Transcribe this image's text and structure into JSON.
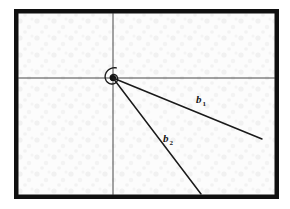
{
  "figure": {
    "kind": "logarithmic-spiral-diagram",
    "width": 290,
    "height": 209,
    "background_color": "#fbfbfb",
    "page_color": "#ffffff",
    "frame": {
      "name": "figure-border",
      "color": "#101010",
      "x": 14,
      "y": 9,
      "width": 265,
      "height": 190,
      "stroke_width": 4.5
    },
    "ink_color": "#1a1a1a",
    "axis_color": "#333333",
    "axis_stroke_width": 0.9,
    "curve_stroke_width": 1.3,
    "vector_stroke_width": 1.5
  },
  "labels": {
    "b1": {
      "base": "b",
      "sub": "1",
      "x": 196,
      "y": 103
    },
    "b2": {
      "base": "b",
      "sub": "2",
      "x": 163,
      "y": 142
    }
  },
  "chart_data": {
    "type": "line",
    "title": "",
    "subtitle": "",
    "xlabel": "",
    "ylabel": "",
    "grid": false,
    "legend_position": "none",
    "curve_name": "logarithmic spiral",
    "polar_equation": "r = a * e^(k*theta)",
    "pole": {
      "x": 113,
      "y": 78
    },
    "spiral_params": {
      "a": 0.55,
      "k": 0.1685,
      "theta_start": -2.2,
      "theta_end": 17.6
    },
    "axes": [
      {
        "name": "horizontal-axis",
        "x1": 18,
        "y1": 78,
        "x2": 275,
        "y2": 78
      },
      {
        "name": "vertical-axis",
        "x1": 113,
        "y1": 13,
        "x2": 113,
        "y2": 195
      }
    ],
    "radius_vectors": [
      {
        "name": "b1",
        "label": "b1",
        "x1": 113,
        "y1": 78,
        "x2": 262,
        "y2": 139,
        "angle_deg": 22.3,
        "length_px": 161
      },
      {
        "name": "b2",
        "label": "b2",
        "x1": 113,
        "y1": 78,
        "x2": 201,
        "y2": 194,
        "angle_deg": 52.8,
        "length_px": 146
      }
    ],
    "annotations": [
      {
        "text": "b",
        "sub": "1",
        "x": 196,
        "y": 103
      },
      {
        "text": "b",
        "sub": "2",
        "x": 163,
        "y": 142
      }
    ]
  }
}
